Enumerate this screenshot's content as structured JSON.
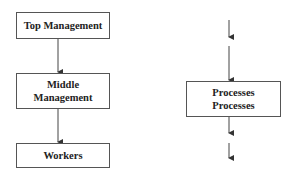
{
  "left_diagram": {
    "boxes": [
      {
        "lines": [
          "Top Management"
        ]
      },
      {
        "lines": [
          "Middle",
          "Management"
        ]
      },
      {
        "lines": [
          "Workers"
        ]
      }
    ]
  },
  "right_diagram": {
    "box": {
      "lines": [
        "Processes",
        "Processes"
      ]
    }
  },
  "colors": {
    "stroke": "#444444",
    "text": "#222222"
  }
}
